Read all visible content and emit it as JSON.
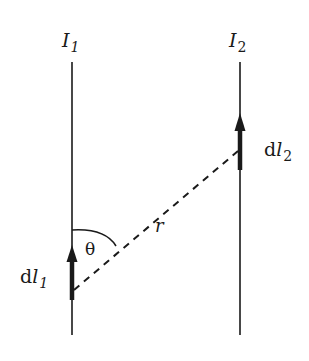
{
  "diagram": {
    "wires": [
      {
        "id": "wire-1",
        "current_label": "I",
        "current_subscript": "1",
        "x": 72,
        "y_top": 62,
        "y_bottom": 335
      },
      {
        "id": "wire-2",
        "current_label": "I",
        "current_subscript": "2",
        "x": 240,
        "y_top": 62,
        "y_bottom": 335
      }
    ],
    "elements": [
      {
        "id": "dl1",
        "label_prefix": "d",
        "label_var": "l",
        "label_sub": "1",
        "x": 72,
        "y_tail": 300,
        "y_head": 246
      },
      {
        "id": "dl2",
        "label_prefix": "d",
        "label_var": "l",
        "label_sub": "2",
        "x": 240,
        "y_tail": 170,
        "y_head": 114
      }
    ],
    "separation": {
      "label": "r",
      "from": [
        72,
        292
      ],
      "to": [
        240,
        150
      ]
    },
    "angle": {
      "label": "θ"
    },
    "colors": {
      "ink": "#1a1a1a",
      "background": "#ffffff"
    }
  }
}
